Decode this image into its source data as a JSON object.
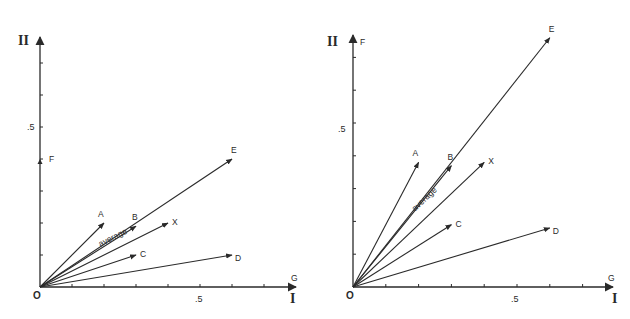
{
  "diagrams": [
    {
      "id": "left",
      "x_axis_label": "I",
      "y_axis_label": "II",
      "origin_label": "O",
      "x_tick_label": ".5",
      "y_tick_label": ".5",
      "x_end_label": "G",
      "y_marker_label": "F",
      "y_marker_value": 0.4,
      "average_label": "average",
      "vectors": [
        {
          "name": "A",
          "x": 0.2,
          "y": 0.2
        },
        {
          "name": "B",
          "x": 0.3,
          "y": 0.19
        },
        {
          "name": "X",
          "x": 0.4,
          "y": 0.2
        },
        {
          "name": "C",
          "x": 0.3,
          "y": 0.1
        },
        {
          "name": "D",
          "x": 0.6,
          "y": 0.1
        },
        {
          "name": "E",
          "x": 0.6,
          "y": 0.4
        }
      ],
      "average_vector": "X"
    },
    {
      "id": "right",
      "x_axis_label": "I",
      "y_axis_label": "II",
      "origin_label": "O",
      "x_tick_label": ".5",
      "y_tick_label": ".5",
      "x_end_label": "G",
      "y_marker_label": "F",
      "y_marker_value": 0.76,
      "average_label": "average",
      "vectors": [
        {
          "name": "A",
          "x": 0.2,
          "y": 0.38
        },
        {
          "name": "B",
          "x": 0.3,
          "y": 0.37
        },
        {
          "name": "X",
          "x": 0.4,
          "y": 0.38
        },
        {
          "name": "C",
          "x": 0.3,
          "y": 0.19
        },
        {
          "name": "D",
          "x": 0.6,
          "y": 0.18
        },
        {
          "name": "E",
          "x": 0.6,
          "y": 0.76
        }
      ],
      "average_vector": "X"
    }
  ],
  "axis_range": {
    "x": [
      0,
      0.8
    ],
    "y": [
      0,
      0.77
    ]
  },
  "tick_step": 0.1
}
